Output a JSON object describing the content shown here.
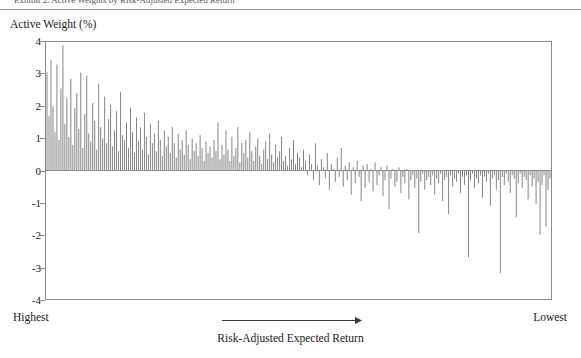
{
  "figure": {
    "top_caption_cropped": "Exhibit 2. Active Weights by Risk-Adjusted Expected Return",
    "y_axis_title": "Active Weight (%)",
    "x_axis_caption": "Risk-Adjusted Expected Return",
    "left_end_label": "Highest",
    "right_end_label": "Lowest",
    "arrow_icon": "right-arrow-icon"
  },
  "colors": {
    "bar": "#808080",
    "frame": "#8c8c8c",
    "zero_line": "#6e6e6e",
    "text": "#1a1a1a",
    "rule": "#9a9a9a"
  },
  "chart_data": {
    "type": "bar",
    "title": "",
    "xlabel": "Risk-Adjusted Expected Return",
    "ylabel": "Active Weight (%)",
    "ylim": [
      -4,
      4
    ],
    "yticks": [
      4,
      3,
      2,
      1,
      0,
      -1,
      -2,
      -3,
      -4
    ],
    "ytick_labels": [
      "4",
      "3",
      "2",
      "1",
      "0",
      "-1",
      "-2",
      "-3",
      "-4"
    ],
    "grid": false,
    "legend": null,
    "x_order": "securities sorted left (highest risk-adjusted expected return) to right (lowest)",
    "x_end_labels": [
      "Highest",
      "Lowest"
    ],
    "bar_color": "#808080",
    "n_bars": 254,
    "values": [
      3.05,
      1.7,
      3.45,
      2.0,
      1.2,
      3.3,
      0.95,
      2.55,
      3.9,
      1.45,
      2.25,
      1.05,
      2.85,
      0.8,
      1.95,
      2.4,
      1.3,
      3.05,
      0.7,
      1.75,
      2.95,
      1.15,
      0.9,
      2.1,
      1.55,
      0.65,
      2.7,
      1.35,
      1.0,
      2.3,
      0.85,
      1.6,
      2.05,
      0.75,
      1.25,
      1.85,
      0.6,
      2.45,
      1.1,
      0.95,
      1.5,
      0.7,
      1.95,
      1.2,
      0.55,
      1.65,
      0.9,
      1.35,
      0.65,
      1.8,
      1.05,
      0.5,
      1.45,
      0.85,
      1.15,
      0.6,
      1.55,
      0.95,
      0.45,
      1.25,
      0.75,
      1.05,
      0.55,
      1.35,
      0.85,
      0.4,
      1.15,
      0.65,
      0.95,
      0.5,
      1.25,
      0.8,
      0.35,
      1.0,
      0.6,
      0.85,
      0.45,
      1.1,
      0.7,
      0.3,
      0.9,
      0.55,
      0.75,
      0.4,
      0.95,
      0.6,
      1.5,
      0.35,
      0.8,
      0.5,
      1.25,
      0.65,
      0.3,
      1.05,
      0.45,
      0.7,
      1.35,
      0.25,
      0.85,
      0.55,
      0.95,
      0.4,
      1.2,
      0.6,
      0.3,
      0.75,
      1.0,
      0.45,
      0.2,
      0.65,
      0.9,
      0.35,
      1.15,
      0.5,
      0.25,
      0.8,
      0.4,
      0.6,
      1.05,
      0.3,
      0.45,
      0.15,
      0.7,
      0.35,
      0.95,
      0.2,
      0.55,
      0.4,
      0.1,
      0.65,
      0.3,
      -0.15,
      0.5,
      0.2,
      -0.3,
      0.85,
      0.15,
      -0.45,
      0.35,
      0.1,
      -0.25,
      0.55,
      -0.6,
      0.2,
      0.05,
      -0.35,
      0.4,
      -0.2,
      0.7,
      -0.5,
      0.15,
      -0.3,
      0.25,
      -0.75,
      0.1,
      -0.4,
      0.3,
      -0.2,
      -0.95,
      0.15,
      -0.55,
      0.2,
      -0.35,
      0.05,
      -0.65,
      0.25,
      -0.45,
      -0.15,
      0.1,
      -0.8,
      -0.3,
      0.15,
      -1.2,
      -0.25,
      0.05,
      -0.5,
      -0.35,
      0.1,
      -0.7,
      -0.2,
      -0.4,
      0.05,
      -0.9,
      -0.3,
      -0.15,
      -0.55,
      -0.25,
      -1.95,
      -0.35,
      -0.1,
      -0.6,
      -0.3,
      -0.2,
      -0.45,
      -0.15,
      -0.75,
      -0.25,
      -0.4,
      -0.1,
      -0.95,
      -0.3,
      -0.2,
      -1.35,
      -0.15,
      -0.5,
      -0.25,
      -0.35,
      -0.1,
      -0.7,
      -0.2,
      -0.45,
      -0.15,
      -2.7,
      -0.3,
      -0.1,
      -0.55,
      -0.25,
      -0.4,
      -0.15,
      -0.85,
      -0.2,
      -0.35,
      -0.1,
      -1.1,
      -0.25,
      -0.15,
      -0.6,
      -0.3,
      -3.2,
      -0.2,
      -0.45,
      -0.1,
      -0.35,
      -0.7,
      -0.15,
      -0.25,
      -1.45,
      -0.4,
      -0.1,
      -0.55,
      -0.2,
      -0.3,
      -0.9,
      -0.15,
      -0.5,
      -0.25,
      -1.05,
      -0.35,
      -2.0,
      -0.45,
      -0.15,
      -1.75,
      -0.6,
      -0.25
    ]
  }
}
